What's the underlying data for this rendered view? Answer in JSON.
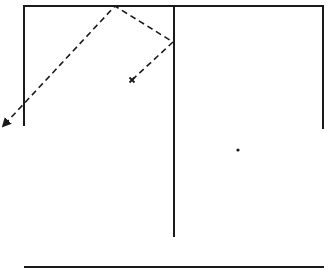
{
  "diagram": {
    "type": "reflection-path-sketch",
    "colors": {
      "background": "#ffffff",
      "stroke": "#1a1a1a"
    },
    "walls": [
      {
        "id": "top-wall",
        "x1": 24,
        "y1": 6,
        "x2": 323,
        "y2": 6
      },
      {
        "id": "left-wall",
        "x1": 24,
        "y1": 6,
        "x2": 24,
        "y2": 125
      },
      {
        "id": "center-divider",
        "x1": 174,
        "y1": 6,
        "x2": 174,
        "y2": 236
      },
      {
        "id": "right-wall",
        "x1": 323,
        "y1": 6,
        "x2": 323,
        "y2": 128
      },
      {
        "id": "floor-line",
        "x1": 25,
        "y1": 267,
        "x2": 323,
        "y2": 267
      }
    ],
    "path": {
      "style": "dashed",
      "points": [
        [
          132,
          80
        ],
        [
          173,
          42
        ],
        [
          115,
          6
        ],
        [
          5,
          124
        ]
      ],
      "start_marker": "x-mark",
      "end_marker": "arrowhead"
    },
    "markers": [
      {
        "id": "start-x",
        "shape": "x",
        "x": 132,
        "y": 80
      },
      {
        "id": "dot",
        "shape": "dot",
        "x": 238,
        "y": 150
      }
    ]
  }
}
